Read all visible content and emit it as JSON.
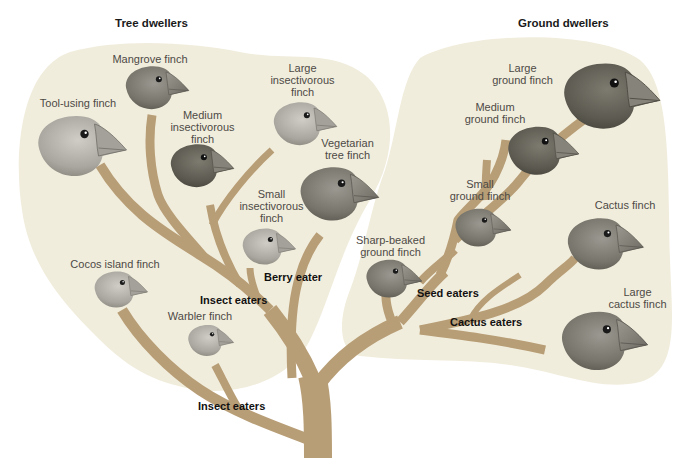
{
  "colors": {
    "blob_fill": "#F1EDDD",
    "branch": "#B89E76",
    "label_text": "#4D4A45",
    "diet_text": "#111111",
    "background": "#FFFFFF"
  },
  "groups": {
    "tree": {
      "title": "Tree dwellers"
    },
    "ground": {
      "title": "Ground dwellers"
    }
  },
  "species": [
    {
      "id": "mangrove",
      "label": "Mangrove finch",
      "group": "tree"
    },
    {
      "id": "tool_using",
      "label": "Tool-using finch",
      "group": "tree"
    },
    {
      "id": "medium_insectivorous",
      "label": "Medium\ninsectivorous\nfinch",
      "group": "tree"
    },
    {
      "id": "large_insectivorous",
      "label": "Large\ninsectivorous\nfinch",
      "group": "tree"
    },
    {
      "id": "vegetarian_tree",
      "label": "Vegetarian\ntree finch",
      "group": "tree"
    },
    {
      "id": "small_insectivorous",
      "label": "Small\ninsectivorous\nfinch",
      "group": "tree"
    },
    {
      "id": "cocos_island",
      "label": "Cocos island finch",
      "group": "tree"
    },
    {
      "id": "warbler",
      "label": "Warbler finch",
      "group": "tree"
    },
    {
      "id": "large_ground",
      "label": "Large\nground finch",
      "group": "ground"
    },
    {
      "id": "medium_ground",
      "label": "Medium\nground finch",
      "group": "ground"
    },
    {
      "id": "small_ground",
      "label": "Small\nground finch",
      "group": "ground"
    },
    {
      "id": "sharp_beaked_ground",
      "label": "Sharp-beaked\nground finch",
      "group": "ground"
    },
    {
      "id": "cactus",
      "label": "Cactus finch",
      "group": "ground"
    },
    {
      "id": "large_cactus",
      "label": "Large\ncactus finch",
      "group": "ground"
    }
  ],
  "diet_labels": {
    "berry_eater": "Berry eater",
    "insect_eaters_upper": "Insect eaters",
    "insect_eaters_lower": "Insect eaters",
    "seed_eaters": "Seed eaters",
    "cactus_eaters": "Cactus eaters"
  }
}
